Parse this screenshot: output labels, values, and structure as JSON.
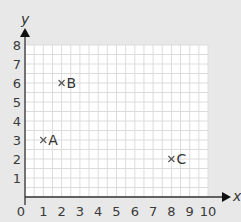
{
  "chart_data": {
    "type": "scatter",
    "title": "",
    "xlabel": "x",
    "ylabel": "y",
    "xlim": [
      0,
      10
    ],
    "ylim": [
      0,
      8
    ],
    "grid": true,
    "x_ticks": [
      "0",
      "1",
      "2",
      "3",
      "4",
      "5",
      "6",
      "7",
      "8",
      "9",
      "10"
    ],
    "y_ticks": [
      "1",
      "2",
      "3",
      "4",
      "5",
      "6",
      "7",
      "8"
    ],
    "points": [
      {
        "label": "A",
        "x": 1,
        "y": 3,
        "marker": "×"
      },
      {
        "label": "B",
        "x": 2,
        "y": 6,
        "marker": "×"
      },
      {
        "label": "C",
        "x": 8,
        "y": 2,
        "marker": "×"
      }
    ],
    "colors": {
      "background": "#e8e8e8",
      "plot_area": "#ffffff",
      "grid": "#dcdcdc",
      "axis": "#333333",
      "text": "#3a3a3a"
    }
  }
}
